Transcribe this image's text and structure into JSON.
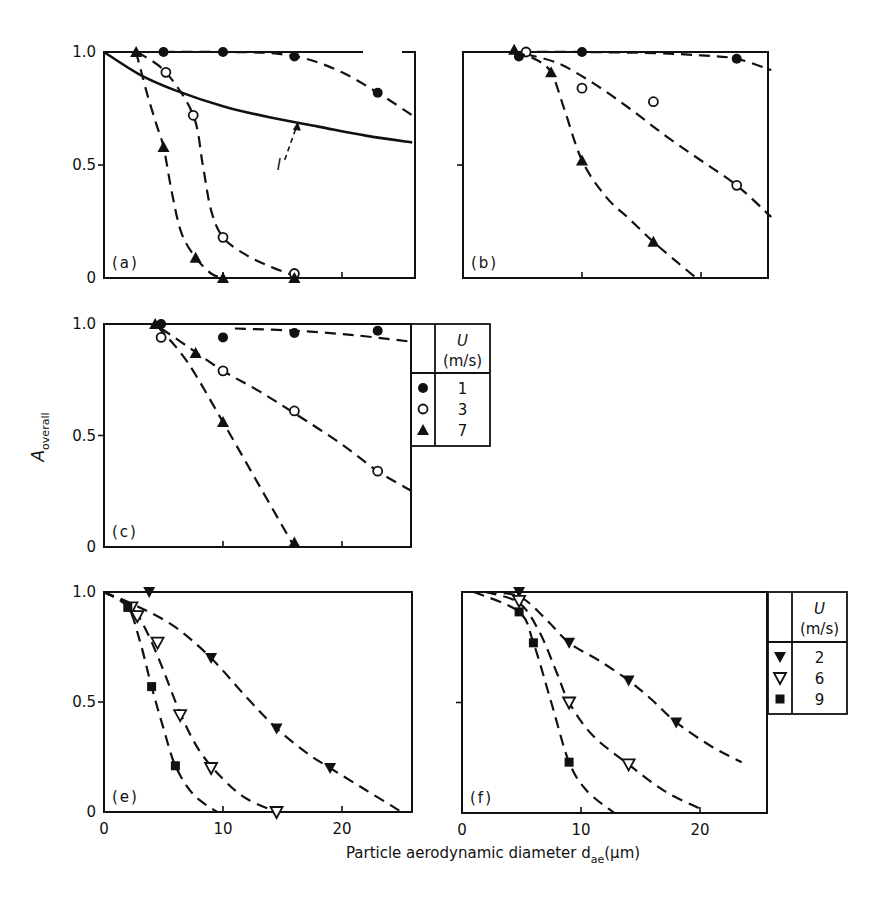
{
  "figure": {
    "y_axis_label": "A",
    "y_axis_label_sub": "overall",
    "x_axis_label": "Particle aerodynamic diameter d",
    "x_axis_label_sub": "ae",
    "x_axis_unit": "(μm)",
    "y_tick_labels": [
      "0",
      "0.5",
      "1.0"
    ],
    "x_tick_labels": [
      "0",
      "10",
      "20"
    ],
    "curve_annotation": "I"
  },
  "legends": [
    {
      "header_symbol": "U",
      "header_unit": "(m/s)",
      "entries": [
        {
          "marker": "filled-circle",
          "label": "1"
        },
        {
          "marker": "open-circle",
          "label": "3"
        },
        {
          "marker": "filled-triangle-up",
          "label": "7"
        }
      ]
    },
    {
      "header_symbol": "U",
      "header_unit": "(m/s)",
      "entries": [
        {
          "marker": "filled-triangle-down",
          "label": "2"
        },
        {
          "marker": "open-triangle-down",
          "label": "6"
        },
        {
          "marker": "filled-square",
          "label": "9"
        }
      ]
    }
  ],
  "chart_data": [
    {
      "type": "scatter",
      "panel": "(a)",
      "xlabel": "Particle aerodynamic diameter d_ae (μm)",
      "ylabel": "A_overall",
      "xlim": [
        0,
        26
      ],
      "ylim": [
        0,
        1.0
      ],
      "series": [
        {
          "name": "U = 1 m/s",
          "marker": "filled-circle",
          "points": [
            [
              5,
              1.0
            ],
            [
              10,
              1.0
            ],
            [
              16,
              0.98
            ],
            [
              23,
              0.82
            ]
          ],
          "curve": [
            [
              5,
              1.0
            ],
            [
              10,
              1.0
            ],
            [
              14,
              0.995
            ],
            [
              17,
              0.97
            ],
            [
              20,
              0.91
            ],
            [
              23,
              0.82
            ],
            [
              25.9,
              0.72
            ]
          ]
        },
        {
          "name": "U = 3 m/s",
          "marker": "open-circle",
          "points": [
            [
              5.2,
              0.91
            ],
            [
              7.5,
              0.72
            ],
            [
              10,
              0.18
            ],
            [
              16,
              0.02
            ]
          ],
          "curve": [
            [
              2.8,
              1.0
            ],
            [
              5.2,
              0.91
            ],
            [
              7.5,
              0.72
            ],
            [
              8.3,
              0.5
            ],
            [
              9.0,
              0.3
            ],
            [
              10,
              0.18
            ],
            [
              12,
              0.1
            ],
            [
              14,
              0.05
            ],
            [
              16,
              0.01
            ]
          ]
        },
        {
          "name": "U = 7 m/s",
          "marker": "filled-triangle-up",
          "points": [
            [
              2.7,
              1.0
            ],
            [
              5.0,
              0.58
            ],
            [
              7.7,
              0.09
            ],
            [
              10,
              0.0
            ],
            [
              16,
              0.0
            ]
          ],
          "curve": [
            [
              2.7,
              1.0
            ],
            [
              3.6,
              0.82
            ],
            [
              4.4,
              0.68
            ],
            [
              5.0,
              0.58
            ],
            [
              5.7,
              0.38
            ],
            [
              6.5,
              0.2
            ],
            [
              7.7,
              0.09
            ],
            [
              9.0,
              0.02
            ],
            [
              10,
              0.0
            ]
          ]
        },
        {
          "name": "Curve I (theory)",
          "marker": "none",
          "style": "solid",
          "curve": [
            [
              0,
              1.0
            ],
            [
              3,
              0.9
            ],
            [
              6,
              0.83
            ],
            [
              10,
              0.76
            ],
            [
              14,
              0.71
            ],
            [
              18,
              0.67
            ],
            [
              22,
              0.63
            ],
            [
              25.9,
              0.6
            ]
          ]
        }
      ],
      "annotations": [
        {
          "text": "I",
          "arrow_to": [
            16.2,
            0.7
          ]
        }
      ]
    },
    {
      "type": "scatter",
      "panel": "(b)",
      "xlim": [
        0,
        26
      ],
      "ylim": [
        0,
        1.0
      ],
      "series": [
        {
          "name": "U = 1 m/s",
          "marker": "filled-circle",
          "points": [
            [
              4.7,
              0.98
            ],
            [
              10,
              1.0
            ],
            [
              23,
              0.97
            ]
          ],
          "curve": [
            [
              4.7,
              1.0
            ],
            [
              10,
              1.0
            ],
            [
              16,
              0.995
            ],
            [
              20,
              0.985
            ],
            [
              23,
              0.97
            ],
            [
              25.9,
              0.92
            ]
          ]
        },
        {
          "name": "U = 3 m/s",
          "marker": "open-circle",
          "points": [
            [
              5.3,
              1.0
            ],
            [
              10,
              0.84
            ],
            [
              16,
              0.78
            ],
            [
              23,
              0.41
            ]
          ],
          "curve": [
            [
              5.3,
              0.99
            ],
            [
              8,
              0.95
            ],
            [
              11,
              0.86
            ],
            [
              14,
              0.75
            ],
            [
              17,
              0.63
            ],
            [
              20,
              0.52
            ],
            [
              23,
              0.41
            ],
            [
              25.9,
              0.27
            ]
          ]
        },
        {
          "name": "U = 7 m/s",
          "marker": "filled-triangle-up",
          "points": [
            [
              4.3,
              1.01
            ],
            [
              7.4,
              0.91
            ],
            [
              10,
              0.52
            ],
            [
              16,
              0.16
            ]
          ],
          "curve": [
            [
              4.3,
              1.0
            ],
            [
              6,
              0.97
            ],
            [
              7.4,
              0.91
            ],
            [
              8.5,
              0.75
            ],
            [
              10,
              0.52
            ],
            [
              12,
              0.36
            ],
            [
              14,
              0.26
            ],
            [
              16,
              0.16
            ],
            [
              18,
              0.07
            ],
            [
              19.6,
              0.0
            ]
          ]
        }
      ]
    },
    {
      "type": "scatter",
      "panel": "(c)",
      "xlim": [
        0,
        26
      ],
      "ylim": [
        0,
        1.0
      ],
      "series": [
        {
          "name": "U = 1 m/s",
          "marker": "filled-circle",
          "points": [
            [
              4.8,
              1.0
            ],
            [
              10,
              0.94
            ],
            [
              16,
              0.96
            ],
            [
              23,
              0.97
            ]
          ],
          "curve": [
            [
              11,
              0.98
            ],
            [
              16,
              0.97
            ],
            [
              21,
              0.95
            ],
            [
              25.9,
              0.92
            ]
          ]
        },
        {
          "name": "U = 3 m/s",
          "marker": "open-circle",
          "points": [
            [
              4.8,
              0.94
            ],
            [
              10,
              0.79
            ],
            [
              16,
              0.61
            ],
            [
              23,
              0.34
            ]
          ],
          "curve": [
            [
              4.8,
              0.98
            ],
            [
              7,
              0.9
            ],
            [
              10,
              0.79
            ],
            [
              13,
              0.7
            ],
            [
              16,
              0.6
            ],
            [
              20,
              0.46
            ],
            [
              23,
              0.34
            ],
            [
              25.9,
              0.25
            ]
          ]
        },
        {
          "name": "U = 7 m/s",
          "marker": "filled-triangle-up",
          "points": [
            [
              4.3,
              1.0
            ],
            [
              7.7,
              0.87
            ],
            [
              10,
              0.56
            ],
            [
              16,
              0.02
            ]
          ],
          "curve": [
            [
              4.5,
              0.99
            ],
            [
              7,
              0.83
            ],
            [
              10,
              0.56
            ],
            [
              13,
              0.28
            ],
            [
              16,
              0.0
            ]
          ]
        }
      ]
    },
    {
      "type": "scatter",
      "panel": "(e)",
      "xlim": [
        0,
        25.7
      ],
      "ylim": [
        0,
        1.0
      ],
      "series": [
        {
          "name": "U = 2 m/s",
          "marker": "filled-triangle-down",
          "points": [
            [
              3.8,
              1.0
            ],
            [
              9,
              0.7
            ],
            [
              14.5,
              0.38
            ],
            [
              19,
              0.2
            ]
          ],
          "curve": [
            [
              0,
              1.0
            ],
            [
              3,
              0.93
            ],
            [
              6,
              0.84
            ],
            [
              9,
              0.7
            ],
            [
              12,
              0.52
            ],
            [
              14.5,
              0.38
            ],
            [
              17,
              0.27
            ],
            [
              19,
              0.2
            ],
            [
              22,
              0.1
            ],
            [
              25,
              0.0
            ]
          ]
        },
        {
          "name": "U = 6 m/s",
          "marker": "open-triangle-down",
          "points": [
            [
              2.3,
              0.93
            ],
            [
              2.8,
              0.89
            ],
            [
              4.5,
              0.77
            ],
            [
              6.4,
              0.44
            ],
            [
              9,
              0.2
            ],
            [
              14.5,
              0.0
            ]
          ],
          "curve": [
            [
              0,
              1.0
            ],
            [
              2.3,
              0.93
            ],
            [
              3.5,
              0.83
            ],
            [
              4.8,
              0.67
            ],
            [
              6.4,
              0.45
            ],
            [
              8,
              0.28
            ],
            [
              10,
              0.15
            ],
            [
              12,
              0.06
            ],
            [
              14.5,
              0.0
            ]
          ]
        },
        {
          "name": "U = 9 m/s",
          "marker": "filled-square",
          "points": [
            [
              2,
              0.93
            ],
            [
              4,
              0.57
            ],
            [
              6,
              0.21
            ]
          ],
          "curve": [
            [
              0,
              1.0
            ],
            [
              2,
              0.93
            ],
            [
              3,
              0.78
            ],
            [
              4,
              0.57
            ],
            [
              5,
              0.38
            ],
            [
              6,
              0.21
            ],
            [
              7.5,
              0.08
            ],
            [
              9.5,
              0.0
            ]
          ]
        }
      ]
    },
    {
      "type": "scatter",
      "panel": "(f)",
      "xlim": [
        0,
        25.9
      ],
      "ylim": [
        0,
        1.0
      ],
      "series": [
        {
          "name": "U = 2 m/s",
          "marker": "filled-triangle-down",
          "points": [
            [
              4.8,
              1.0
            ],
            [
              9,
              0.77
            ],
            [
              14,
              0.6
            ],
            [
              18,
              0.41
            ]
          ],
          "curve": [
            [
              2,
              1.0
            ],
            [
              4.8,
              0.98
            ],
            [
              7,
              0.88
            ],
            [
              9,
              0.77
            ],
            [
              11.5,
              0.69
            ],
            [
              14,
              0.6
            ],
            [
              16,
              0.51
            ],
            [
              18,
              0.41
            ],
            [
              21,
              0.3
            ],
            [
              23.5,
              0.23
            ]
          ]
        },
        {
          "name": "U = 6 m/s",
          "marker": "open-triangle-down",
          "points": [
            [
              4.8,
              0.96
            ],
            [
              9,
              0.5
            ],
            [
              14,
              0.22
            ]
          ],
          "curve": [
            [
              2,
              1.0
            ],
            [
              4.8,
              0.95
            ],
            [
              6.5,
              0.82
            ],
            [
              8,
              0.63
            ],
            [
              9,
              0.5
            ],
            [
              11,
              0.35
            ],
            [
              14,
              0.22
            ],
            [
              17,
              0.1
            ],
            [
              20,
              0.02
            ]
          ]
        },
        {
          "name": "U = 9 m/s",
          "marker": "filled-square",
          "points": [
            [
              4.8,
              0.91
            ],
            [
              6,
              0.77
            ],
            [
              9,
              0.23
            ]
          ],
          "curve": [
            [
              1,
              1.0
            ],
            [
              4.8,
              0.91
            ],
            [
              6,
              0.77
            ],
            [
              7.5,
              0.5
            ],
            [
              9,
              0.23
            ],
            [
              10.5,
              0.1
            ],
            [
              12.8,
              0.0
            ]
          ]
        }
      ]
    }
  ]
}
